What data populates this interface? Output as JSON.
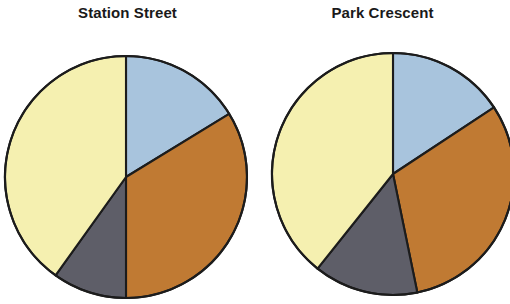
{
  "figure": {
    "background": "#ffffff",
    "outline_color": "#1c1c1c"
  },
  "palette": {
    "blue": "#a8c4dd",
    "brown": "#c07a33",
    "grey": "#5e5e68",
    "yellow": "#f5f0b0"
  },
  "charts": [
    {
      "id": "station-street",
      "title": "Station Street",
      "center_x": 126,
      "center_y": 177,
      "radius": 121
    },
    {
      "id": "park-crescent",
      "title": "Park Crescent",
      "center_x": 138,
      "center_y": 174,
      "radius": 121
    }
  ],
  "chart_data": [
    {
      "type": "pie",
      "title": "Station Street",
      "labels": [
        "Blue segment",
        "Brown segment",
        "Grey segment",
        "Yellow segment"
      ],
      "values": [
        16.3,
        33.8,
        9.9,
        40.0
      ],
      "unit": "percent",
      "start_angle_deg": 0,
      "direction": "clockwise",
      "segment_angles_deg": [
        58.5,
        121.5,
        35.6,
        144.4
      ],
      "colors": [
        "#a8c4dd",
        "#c07a33",
        "#5e5e68",
        "#f5f0b0"
      ],
      "legend": "none",
      "grid": false
    },
    {
      "type": "pie",
      "title": "Park Crescent",
      "labels": [
        "Blue segment",
        "Brown segment",
        "Grey segment",
        "Yellow segment"
      ],
      "values": [
        15.7,
        31.1,
        13.9,
        39.3
      ],
      "unit": "percent",
      "start_angle_deg": 0,
      "direction": "clockwise",
      "segment_angles_deg": [
        56.6,
        111.8,
        50.2,
        141.4
      ],
      "colors": [
        "#a8c4dd",
        "#c07a33",
        "#5e5e68",
        "#f5f0b0"
      ],
      "legend": "none",
      "grid": false
    }
  ]
}
